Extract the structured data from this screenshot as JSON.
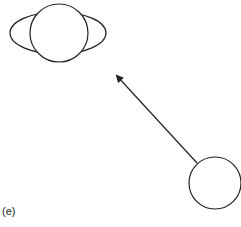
{
  "figure": {
    "panel_label": "(e)",
    "stroke_color": "#222222",
    "background": "#ffffff",
    "elements": {
      "head_top_view": {
        "ellipse": {
          "cx": 58,
          "cy": 33,
          "rx": 48,
          "ry": 21
        },
        "circle": {
          "cx": 59,
          "cy": 33,
          "r": 29
        },
        "nose_bump": {
          "cx": 57,
          "cy": 56,
          "r": 5
        }
      },
      "arrow": {
        "from": [
          197,
          163
        ],
        "to": [
          116,
          75
        ]
      },
      "source_circle": {
        "cx": 215,
        "cy": 183,
        "r": 26
      }
    }
  }
}
